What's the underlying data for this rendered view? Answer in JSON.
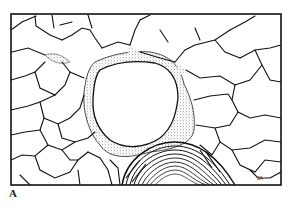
{
  "figure": {
    "panel_label": "A",
    "artist_initials": "JA",
    "colors": {
      "ink": "#111111",
      "paper": "#ffffff",
      "stipple": "#bdbdbd"
    }
  }
}
